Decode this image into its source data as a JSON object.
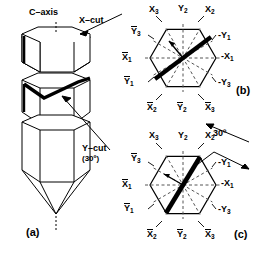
{
  "figure": {
    "panels": [
      {
        "id": "a",
        "label": "(a)",
        "caption": "Quartz crystal bar showing C-axis, X-cut and Y-cut planes"
      },
      {
        "id": "b",
        "label": "(b)",
        "caption": "X-cut hexagonal cross-section"
      },
      {
        "id": "c",
        "label": "(c)",
        "caption": "Y-cut (30 degrees) hexagonal cross-section"
      }
    ]
  },
  "crystal": {
    "c_axis_label": "C–axis",
    "x_cut_label": "X–cut",
    "y_cut_label": "Y–cut",
    "y_cut_angle": "(30º)",
    "panel_label": "(a)"
  },
  "hex_b": {
    "panel_label": "(b)",
    "labels": {
      "top_left": "X",
      "top_left_sub": "3",
      "top_mid": "Y",
      "top_mid_sub": "2",
      "top_right": "X",
      "top_right_sub": "2",
      "upper_left_diag": "Y",
      "upper_left_diag_sub": "3",
      "upper_right_diag": "-Y",
      "upper_right_diag_sub": "1",
      "left": "X",
      "left_sub": "1",
      "right": "-X",
      "right_sub": "1",
      "lower_left_diag": "Y",
      "lower_left_diag_sub": "1",
      "lower_right_diag": "-Y",
      "lower_right_diag_sub": "3",
      "bottom_left": "X",
      "bottom_left_sub": "2",
      "bottom_mid": "Y",
      "bottom_mid_sub": "2",
      "bottom_right": "X",
      "bottom_right_sub": "3"
    }
  },
  "hex_c": {
    "panel_label": "(c)",
    "angle_annotation": "30º",
    "labels": {
      "top_left": "X",
      "top_left_sub": "3",
      "top_mid": "Y",
      "top_mid_sub": "2",
      "top_right": "X",
      "top_right_sub": "2",
      "upper_left_diag": "Y",
      "upper_left_diag_sub": "3",
      "upper_right_diag": "-Y",
      "upper_right_diag_sub": "1",
      "left": "X",
      "left_sub": "1",
      "right": "-X",
      "right_sub": "1",
      "lower_left_diag": "Y",
      "lower_left_diag_sub": "1",
      "lower_right_diag": "-Y",
      "lower_right_diag_sub": "3",
      "bottom_left": "X",
      "bottom_left_sub": "2",
      "bottom_mid": "Y",
      "bottom_mid_sub": "2",
      "bottom_right": "X",
      "bottom_right_sub": "3"
    }
  },
  "colors": {
    "ink": "#000000",
    "paper": "#ffffff",
    "dashed": "#555555"
  }
}
